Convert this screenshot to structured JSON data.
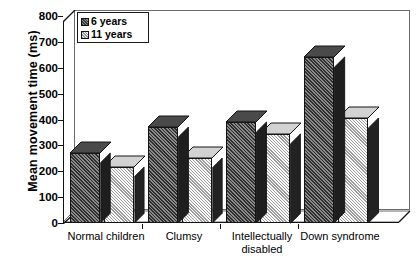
{
  "chart_data": {
    "type": "bar",
    "title": "",
    "xlabel": "",
    "ylabel": "Mean movement time (ms)",
    "ylim": [
      0,
      800
    ],
    "yticks": [
      800,
      700,
      600,
      500,
      400,
      300,
      200,
      100,
      0
    ],
    "ytick_labels": [
      "800",
      "700",
      "600",
      "500",
      "400",
      "300",
      "200",
      "100",
      "0"
    ],
    "grid": false,
    "legend_position": "top-left",
    "categories": [
      "Normal children",
      "Clumsy",
      "Intellectually disabled",
      "Down syndrome"
    ],
    "category_lines": [
      [
        "Normal children"
      ],
      [
        "Clumsy"
      ],
      [
        "Intellectually",
        "disabled"
      ],
      [
        "Down syndrome"
      ]
    ],
    "series": [
      {
        "name": "6 years",
        "values": [
          270,
          370,
          390,
          640
        ],
        "swatch": "dark"
      },
      {
        "name": "11 years",
        "values": [
          215,
          250,
          345,
          405
        ],
        "swatch": "light"
      }
    ]
  },
  "legend": {
    "entries": [
      {
        "label": "6 years"
      },
      {
        "label": "11 years"
      }
    ]
  },
  "colors": {
    "axis": "#111111",
    "frame": "#6b6b6b",
    "bar_dark_face": "#5c5c5c",
    "bar_dark_side": "#1e1e1e",
    "bar_dark_top": "#4a4a4a",
    "bar_light_face": "#e3e3e3",
    "bar_light_side": "#222222",
    "bar_light_top": "#d2d2d2",
    "background": "#ffffff"
  }
}
